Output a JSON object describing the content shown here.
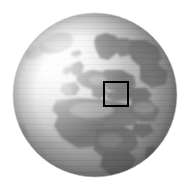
{
  "figure": {
    "type": "globe-locator-map",
    "width": 192,
    "height": 188,
    "background_color": "#ffffff",
    "title": "",
    "caption": "",
    "rendering": "grayscale shaded relief",
    "projection": "orthographic"
  },
  "globe": {
    "center_x": 95,
    "center_y": 95,
    "radius": 82,
    "ocean_color": "#9a9a9a",
    "land_color": "#8a8a8a",
    "highlight_color": "#f2f2f2",
    "shadow_color": "#6f6f6f",
    "terminator_color": "#5e5e5e",
    "light_direction": "upper-left",
    "visible_hemisphere": "Europe, Africa, North Atlantic, Middle East"
  },
  "features": {
    "landmasses": [
      "Greenland",
      "Scandinavia",
      "British Isles",
      "Iberian Peninsula",
      "Western Europe",
      "Eastern Europe",
      "Mediterranean Basin",
      "North Africa",
      "Sahara",
      "Sub-Saharan Africa",
      "Arabian Peninsula",
      "Madagascar"
    ],
    "oceans": [
      "North Atlantic Ocean",
      "South Atlantic Ocean",
      "Mediterranean Sea",
      "Indian Ocean"
    ]
  },
  "roi_box": {
    "label": "",
    "x": 103,
    "y": 81,
    "width": 26,
    "height": 26,
    "stroke_color": "#000000",
    "stroke_width": 2,
    "fill": "none",
    "region": "Eastern Mediterranean / Black Sea"
  }
}
